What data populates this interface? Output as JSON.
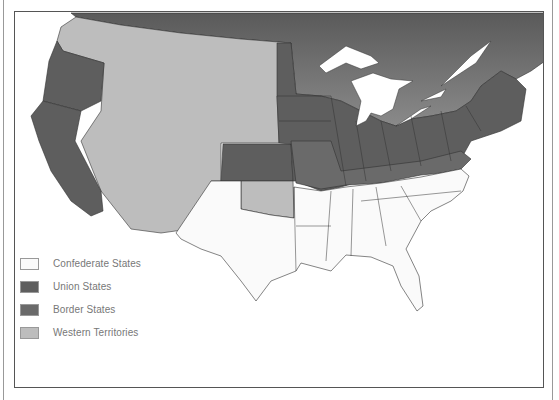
{
  "map": {
    "subject": "United States during the Civil War (1861)",
    "colors": {
      "confederate": "#fafafa",
      "union": "#5e5e5e",
      "border": "#6a6a6a",
      "western": "#bdbdbd",
      "canada": "#727272",
      "water": "#ffffff",
      "outline": "#333333"
    }
  },
  "legend": {
    "items": [
      {
        "label": "Confederate States",
        "color": "#fafafa"
      },
      {
        "label": "Union States",
        "color": "#5e5e5e"
      },
      {
        "label": "Border States",
        "color": "#6a6a6a"
      },
      {
        "label": "Western Territories",
        "color": "#bdbdbd"
      }
    ]
  }
}
